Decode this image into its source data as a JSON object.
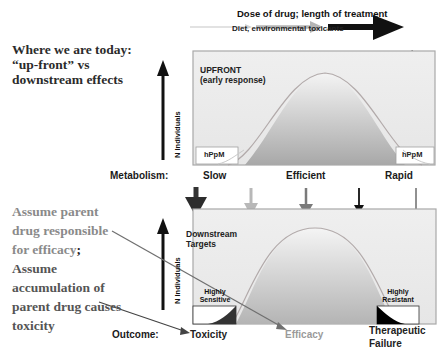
{
  "header": {
    "dose_label": "Dose of drug; length of treatment",
    "diet_label": "Diet, environmental toxicants"
  },
  "left_text": {
    "title_lines": [
      "Where we are today:",
      "“up-front” vs",
      "downstream effects"
    ],
    "note1_lines": [
      "Assume parent",
      "drug responsible",
      "for efficacy"
    ],
    "note1_semicolon": ";",
    "note2_lines": [
      "Assume",
      "accumulation of",
      "parent drug causes",
      "toxicity"
    ]
  },
  "top_panel": {
    "title_line1": "UPFRONT",
    "title_line2": "(early response)",
    "y_axis_label": "N Individuals",
    "left_box": "hPpM",
    "right_box": "hPpM"
  },
  "metabolism": {
    "label": "Metabolism:",
    "categories": [
      "Slow",
      "Efficient",
      "Rapid"
    ]
  },
  "bottom_panel": {
    "title_line1": "Downstream",
    "title_line2": "Targets",
    "y_axis_label": "N Individuals",
    "left_box_lines": [
      "Highly",
      "Sensitive"
    ],
    "right_box_lines": [
      "Highly",
      "Resistant"
    ]
  },
  "outcome": {
    "label": "Outcome:",
    "toxicity": "Toxicity",
    "efficacy": "Efficacy",
    "failure_line1": "Therapeutic",
    "failure_line2": "Failure"
  },
  "colors": {
    "panel_bg": "#ececec",
    "panel_border": "#a8a8a8",
    "curve_light": "#f2f2f2",
    "curve_dark": "#a9a9a9",
    "curve_stroke": "#b0a6a6",
    "arrow_dark": "#222222",
    "arrow_light": "#b8b8b8",
    "arrow_mid": "#7a7a7a",
    "efficacy_text": "#9a9a9a"
  }
}
